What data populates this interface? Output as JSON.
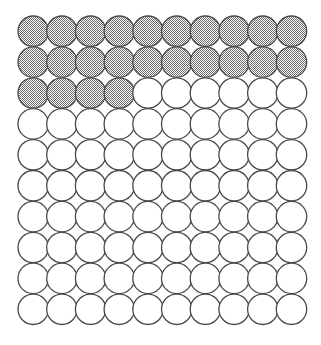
{
  "figure": {
    "background_color": "#ffffff"
  },
  "grid": {
    "rows": 10,
    "columns": 10,
    "total_circles": 100,
    "filled_count": 24,
    "empty_count": 76,
    "origin_x": 18,
    "origin_y": 16,
    "pitch_x": 28.7,
    "pitch_y": 30.9,
    "radius": 15.2,
    "stroke_color": "#4a4a4a",
    "stroke_width": 1.3,
    "empty_fill_color": "#ffffff",
    "filled_fill_color": "#a8a8a8",
    "filled_pattern": "halftone-dither-50",
    "row_fill_counts": [
      10,
      10,
      4,
      0,
      0,
      0,
      0,
      0,
      0,
      0
    ],
    "cells": [
      [
        1,
        1,
        1,
        1,
        1,
        1,
        1,
        1,
        1,
        1
      ],
      [
        1,
        1,
        1,
        1,
        1,
        1,
        1,
        1,
        1,
        1
      ],
      [
        1,
        1,
        1,
        1,
        0,
        0,
        0,
        0,
        0,
        0
      ],
      [
        0,
        0,
        0,
        0,
        0,
        0,
        0,
        0,
        0,
        0
      ],
      [
        0,
        0,
        0,
        0,
        0,
        0,
        0,
        0,
        0,
        0
      ],
      [
        0,
        0,
        0,
        0,
        0,
        0,
        0,
        0,
        0,
        0
      ],
      [
        0,
        0,
        0,
        0,
        0,
        0,
        0,
        0,
        0,
        0
      ],
      [
        0,
        0,
        0,
        0,
        0,
        0,
        0,
        0,
        0,
        0
      ],
      [
        0,
        0,
        0,
        0,
        0,
        0,
        0,
        0,
        0,
        0
      ],
      [
        0,
        0,
        0,
        0,
        0,
        0,
        0,
        0,
        0,
        0
      ]
    ]
  }
}
